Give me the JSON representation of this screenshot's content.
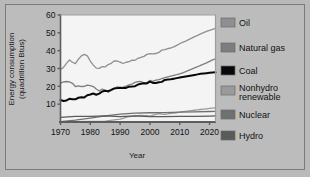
{
  "chart_data": {
    "type": "line",
    "title": "",
    "xlabel": "Year",
    "ylabel": "Energy consumption (quadrillion Btus)",
    "ylabel_line1": "Energy consumption",
    "ylabel_line2": "(quadrillion Btus)",
    "xlim": [
      1970,
      2022
    ],
    "ylim": [
      0,
      60
    ],
    "xticks": [
      1970,
      1980,
      1990,
      2000,
      2010,
      2020
    ],
    "yticks": [
      10,
      20,
      30,
      40,
      50,
      60
    ],
    "grid": false,
    "legend_position": "right",
    "series": [
      {
        "name": "Oil",
        "color": "#8f8f8f",
        "x": [
          1970,
          1971,
          1972,
          1973,
          1974,
          1975,
          1976,
          1977,
          1978,
          1979,
          1980,
          1981,
          1982,
          1983,
          1984,
          1985,
          1986,
          1987,
          1988,
          1989,
          1990,
          1991,
          1992,
          1993,
          1994,
          1995,
          1996,
          1997,
          1998,
          1999,
          2000,
          2001,
          2002,
          2003,
          2004,
          2005,
          2006,
          2007,
          2008,
          2009,
          2010,
          2011,
          2012,
          2013,
          2014,
          2015,
          2016,
          2017,
          2018,
          2019,
          2020,
          2021,
          2022
        ],
        "values": [
          29.5,
          30.6,
          32.9,
          34.8,
          33.5,
          32.7,
          35.2,
          37.1,
          37.9,
          37.1,
          34.2,
          31.9,
          30.2,
          30.1,
          31.1,
          30.9,
          32.2,
          32.9,
          34.2,
          34.2,
          33.6,
          32.8,
          33.5,
          33.8,
          34.7,
          34.6,
          35.7,
          36.3,
          36.8,
          37.9,
          38.3,
          38.2,
          38.4,
          39.0,
          40.3,
          40.6,
          41.2,
          41.5,
          42.1,
          43.0,
          43.9,
          44.7,
          45.4,
          46.2,
          47.0,
          47.9,
          48.6,
          49.4,
          50.1,
          50.8,
          51.4,
          52.0,
          52.5
        ]
      },
      {
        "name": "Natural gas",
        "color": "#7d7d7d",
        "x": [
          1970,
          1971,
          1972,
          1973,
          1974,
          1975,
          1976,
          1977,
          1978,
          1979,
          1980,
          1981,
          1982,
          1983,
          1984,
          1985,
          1986,
          1987,
          1988,
          1989,
          1990,
          1991,
          1992,
          1993,
          1994,
          1995,
          1996,
          1997,
          1998,
          1999,
          2000,
          2001,
          2002,
          2003,
          2004,
          2005,
          2006,
          2007,
          2008,
          2009,
          2010,
          2011,
          2012,
          2013,
          2014,
          2015,
          2016,
          2017,
          2018,
          2019,
          2020,
          2021,
          2022
        ],
        "values": [
          21.8,
          22.5,
          22.7,
          22.5,
          21.7,
          19.9,
          20.3,
          19.9,
          20.0,
          20.7,
          20.4,
          19.9,
          18.5,
          17.4,
          18.5,
          17.8,
          16.7,
          17.7,
          18.6,
          19.7,
          19.3,
          19.6,
          20.1,
          20.8,
          21.3,
          22.2,
          22.6,
          22.7,
          21.9,
          22.1,
          23.3,
          22.8,
          23.5,
          23.8,
          24.3,
          24.9,
          25.3,
          25.7,
          26.1,
          26.5,
          27.0,
          27.6,
          28.2,
          28.9,
          29.6,
          30.3,
          31.0,
          31.8,
          32.5,
          33.2,
          34.0,
          34.8,
          35.4
        ]
      },
      {
        "name": "Coal",
        "color": "#080808",
        "x": [
          1970,
          1971,
          1972,
          1973,
          1974,
          1975,
          1976,
          1977,
          1978,
          1979,
          1980,
          1981,
          1982,
          1983,
          1984,
          1985,
          1986,
          1987,
          1988,
          1989,
          1990,
          1991,
          1992,
          1993,
          1994,
          1995,
          1996,
          1997,
          1998,
          1999,
          2000,
          2001,
          2002,
          2003,
          2004,
          2005,
          2006,
          2007,
          2008,
          2009,
          2010,
          2011,
          2012,
          2013,
          2014,
          2015,
          2016,
          2017,
          2018,
          2019,
          2020,
          2021,
          2022
        ],
        "values": [
          12.3,
          11.8,
          12.1,
          13.0,
          12.7,
          12.7,
          13.6,
          13.9,
          13.8,
          15.0,
          15.4,
          16.0,
          15.3,
          15.9,
          17.1,
          17.5,
          17.3,
          18.0,
          18.8,
          19.0,
          19.2,
          19.0,
          19.1,
          19.8,
          19.9,
          20.1,
          21.0,
          21.4,
          21.7,
          21.6,
          22.6,
          21.9,
          21.9,
          22.3,
          22.5,
          23.6,
          23.8,
          24.0,
          24.3,
          24.6,
          24.9,
          25.2,
          25.5,
          25.8,
          26.1,
          26.4,
          26.7,
          27.0,
          27.2,
          27.4,
          27.6,
          27.8,
          27.9
        ]
      },
      {
        "name": "Nonhydro renewable",
        "color": "#9a9a9a",
        "x": [
          1970,
          1975,
          1980,
          1985,
          1990,
          1991,
          1992,
          1993,
          1994,
          1995,
          1996,
          1997,
          1998,
          1999,
          2000,
          2001,
          2002,
          2003,
          2004,
          2005,
          2006,
          2007,
          2008,
          2009,
          2010,
          2011,
          2012,
          2013,
          2014,
          2015,
          2016,
          2017,
          2018,
          2019,
          2020,
          2021,
          2022
        ],
        "values": [
          0.1,
          0.2,
          0.3,
          0.5,
          1.6,
          2.0,
          2.6,
          3.0,
          3.2,
          3.4,
          3.6,
          3.7,
          3.6,
          3.5,
          3.3,
          3.8,
          4.3,
          4.7,
          4.4,
          4.3,
          4.5,
          4.8,
          5.0,
          5.2,
          5.5,
          5.8,
          6.0,
          6.2,
          6.4,
          6.6,
          6.8,
          7.0,
          7.2,
          7.4,
          7.6,
          7.8,
          7.9
        ]
      },
      {
        "name": "Nuclear",
        "color": "#707070",
        "x": [
          1970,
          1975,
          1980,
          1985,
          1990,
          1995,
          2000,
          2005,
          2010,
          2015,
          2020,
          2022
        ],
        "values": [
          0.2,
          1.0,
          2.2,
          3.4,
          4.4,
          5.0,
          5.2,
          5.3,
          5.5,
          5.7,
          5.9,
          6.0
        ]
      },
      {
        "name": "Hydro",
        "color": "#5a5a5a",
        "x": [
          1970,
          1975,
          1980,
          1985,
          1990,
          1995,
          2000,
          2005,
          2010,
          2015,
          2020,
          2022
        ],
        "values": [
          2.6,
          3.2,
          3.1,
          3.4,
          3.0,
          3.4,
          3.0,
          3.0,
          3.1,
          3.2,
          3.3,
          3.4
        ]
      }
    ]
  },
  "legend": {
    "items": [
      {
        "label": "Oil",
        "color": "#8f8f8f"
      },
      {
        "label": "Natural gas",
        "color": "#7d7d7d"
      },
      {
        "label": "Coal",
        "color": "#080808"
      },
      {
        "label": "Nonhydro",
        "label2": "renewable",
        "color": "#9a9a9a"
      },
      {
        "label": "Nuclear",
        "color": "#707070"
      },
      {
        "label": "Hydro",
        "color": "#5a5a5a"
      }
    ]
  },
  "colors": {
    "figure_background": "#b9b9b9",
    "plot_background": "#f4f4f4",
    "frame_border": "#7a7a7a",
    "axis": "#5d5d5d",
    "text": "#111111"
  }
}
